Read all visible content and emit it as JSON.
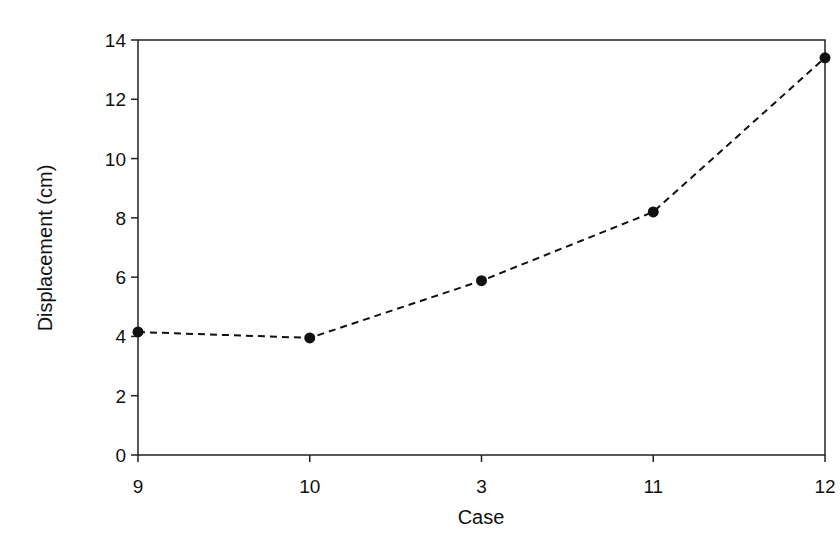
{
  "chart_data": {
    "type": "line",
    "title": "",
    "xlabel": "Case",
    "ylabel": "Displacement (cm)",
    "categories": [
      "9",
      "10",
      "3",
      "11",
      "12"
    ],
    "series": [
      {
        "name": "Displacement",
        "values": [
          4.15,
          3.95,
          5.88,
          8.2,
          13.4
        ],
        "line_style": "dashed",
        "marker": "circle",
        "color": "#111111"
      }
    ],
    "ylim": [
      0,
      14
    ],
    "yticks": [
      0,
      2,
      4,
      6,
      8,
      10,
      12,
      14
    ],
    "grid": false,
    "legend": "none"
  }
}
